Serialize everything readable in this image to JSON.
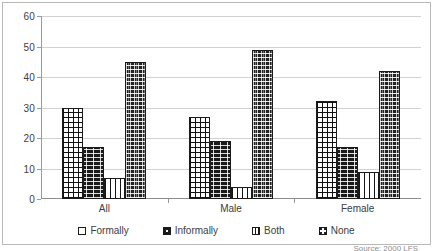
{
  "chart_data": {
    "type": "bar",
    "title": "",
    "xlabel": "",
    "ylabel": "",
    "categories": [
      "All",
      "Male",
      "Female"
    ],
    "series": [
      {
        "name": "Formally",
        "values": [
          30,
          27,
          32
        ],
        "pattern": "grid",
        "color": "#ffffff"
      },
      {
        "name": "Informally",
        "values": [
          17,
          19,
          17
        ],
        "pattern": "dots",
        "color": "#1a1a1a"
      },
      {
        "name": "Both",
        "values": [
          7,
          4,
          9
        ],
        "pattern": "vstripe",
        "color": "#ffffff"
      },
      {
        "name": "None",
        "values": [
          45,
          49,
          42
        ],
        "pattern": "weave",
        "color": "#222222"
      }
    ],
    "ylim": [
      0,
      60
    ],
    "yticks": [
      0,
      10,
      20,
      30,
      40,
      50,
      60
    ],
    "ytick_labels": [
      "0",
      "10",
      "20",
      "30",
      "40",
      "50",
      "60"
    ],
    "grid": true,
    "legend_position": "bottom",
    "legend_entries": [
      "Formally",
      "Informally",
      "Both",
      "None"
    ]
  },
  "axis": {
    "y_labels": [
      "60",
      "50",
      "40",
      "30",
      "20",
      "10",
      "0"
    ]
  },
  "legend": {
    "items": [
      {
        "label": "Formally"
      },
      {
        "label": "Informally"
      },
      {
        "label": "Both"
      },
      {
        "label": "None"
      }
    ]
  },
  "footer": {
    "source": "Source: 2000 LFS"
  }
}
